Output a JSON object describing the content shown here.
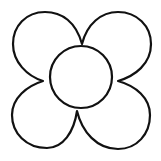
{
  "image": {
    "subject": "flower outline",
    "width": 161,
    "height": 161,
    "background": "#ffffff"
  },
  "drawing": {
    "stroke_color": "#111111",
    "fill_color": "#ffffff",
    "stroke_width": 2.2,
    "petal_count": 4,
    "petals": [
      {
        "name": "top-left"
      },
      {
        "name": "top-right"
      },
      {
        "name": "bottom-right"
      },
      {
        "name": "bottom-left"
      }
    ],
    "center": {
      "cx": 81,
      "cy": 77,
      "r": 31
    }
  }
}
